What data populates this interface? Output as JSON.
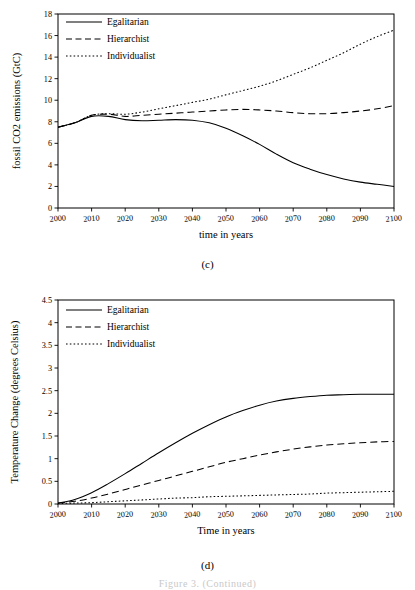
{
  "figure": {
    "caption_c": "(c)",
    "caption_d": "(d)",
    "bottom_caption": "Figure 3.  (Continued)"
  },
  "chart_data": [
    {
      "id": "c",
      "type": "line",
      "title": "",
      "panel_label": "(c)",
      "xlabel": "time in years",
      "ylabel": "fossil CO2 emissions (GtC)",
      "xlim": [
        2000,
        2100
      ],
      "ylim": [
        0,
        18
      ],
      "xticks": [
        2000,
        2010,
        2020,
        2030,
        2040,
        2050,
        2060,
        2070,
        2080,
        2090,
        2100
      ],
      "yticks": [
        0,
        2,
        4,
        6,
        8,
        10,
        12,
        14,
        16,
        18
      ],
      "xtick_labels": [
        "2000",
        "2010",
        "2020",
        "2030",
        "2040",
        "2050",
        "2060",
        "2070",
        "2080",
        "2090",
        "2100"
      ],
      "ytick_labels": [
        "0",
        "2",
        "4",
        "6",
        "8",
        "10",
        "12",
        "14",
        "16",
        "18"
      ],
      "grid": false,
      "legend_position": "upper-left",
      "x": [
        2000,
        2005,
        2010,
        2015,
        2020,
        2025,
        2030,
        2035,
        2040,
        2045,
        2050,
        2055,
        2060,
        2065,
        2070,
        2075,
        2080,
        2085,
        2090,
        2095,
        2100
      ],
      "series": [
        {
          "name": "Egalitarian",
          "style": "solid",
          "values": [
            7.5,
            7.9,
            8.5,
            8.5,
            8.2,
            8.1,
            8.15,
            8.2,
            8.15,
            7.9,
            7.4,
            6.7,
            5.9,
            5.0,
            4.2,
            3.6,
            3.1,
            2.7,
            2.4,
            2.2,
            2.0
          ]
        },
        {
          "name": "Hierarchist",
          "style": "dashed",
          "values": [
            7.5,
            7.9,
            8.6,
            8.7,
            8.5,
            8.6,
            8.7,
            8.8,
            8.9,
            9.0,
            9.1,
            9.15,
            9.1,
            9.0,
            8.85,
            8.75,
            8.75,
            8.85,
            9.0,
            9.2,
            9.5
          ]
        },
        {
          "name": "Individualist",
          "style": "dotted",
          "values": [
            7.5,
            7.9,
            8.6,
            8.75,
            8.7,
            8.9,
            9.2,
            9.5,
            9.8,
            10.1,
            10.5,
            10.9,
            11.3,
            11.8,
            12.4,
            13.0,
            13.7,
            14.4,
            15.2,
            15.9,
            16.5
          ]
        }
      ]
    },
    {
      "id": "d",
      "type": "line",
      "title": "",
      "panel_label": "(d)",
      "xlabel": "Time in years",
      "ylabel": "Temperature Change (degrees Celsius)",
      "xlim": [
        2000,
        2100
      ],
      "ylim": [
        0,
        4.5
      ],
      "xticks": [
        2000,
        2010,
        2020,
        2030,
        2040,
        2050,
        2060,
        2070,
        2080,
        2090,
        2100
      ],
      "yticks": [
        0,
        0.5,
        1,
        1.5,
        2,
        2.5,
        3,
        3.5,
        4,
        4.5
      ],
      "xtick_labels": [
        "2000",
        "2010",
        "2020",
        "2030",
        "2040",
        "2050",
        "2060",
        "2070",
        "2080",
        "2090",
        "2100"
      ],
      "ytick_labels": [
        "0",
        "0.5",
        "1",
        "1.5",
        "2",
        "2.5",
        "3",
        "3.5",
        "4",
        "4.5"
      ],
      "grid": false,
      "legend_position": "upper-left",
      "x": [
        2000,
        2005,
        2010,
        2015,
        2020,
        2025,
        2030,
        2035,
        2040,
        2045,
        2050,
        2055,
        2060,
        2065,
        2070,
        2075,
        2080,
        2085,
        2090,
        2095,
        2100
      ],
      "series": [
        {
          "name": "Egalitarian",
          "style": "solid",
          "values": [
            0.02,
            0.1,
            0.25,
            0.45,
            0.67,
            0.9,
            1.13,
            1.35,
            1.56,
            1.75,
            1.92,
            2.06,
            2.18,
            2.27,
            2.33,
            2.37,
            2.4,
            2.41,
            2.42,
            2.42,
            2.42
          ]
        },
        {
          "name": "Hierarchist",
          "style": "dashed",
          "values": [
            0.02,
            0.06,
            0.13,
            0.22,
            0.32,
            0.42,
            0.52,
            0.62,
            0.72,
            0.82,
            0.92,
            1.0,
            1.08,
            1.15,
            1.21,
            1.26,
            1.3,
            1.33,
            1.35,
            1.37,
            1.38
          ]
        },
        {
          "name": "Individualist",
          "style": "dotted",
          "values": [
            0.01,
            0.02,
            0.03,
            0.05,
            0.07,
            0.09,
            0.11,
            0.13,
            0.14,
            0.16,
            0.17,
            0.18,
            0.19,
            0.2,
            0.21,
            0.22,
            0.24,
            0.25,
            0.26,
            0.27,
            0.28
          ]
        }
      ]
    }
  ]
}
